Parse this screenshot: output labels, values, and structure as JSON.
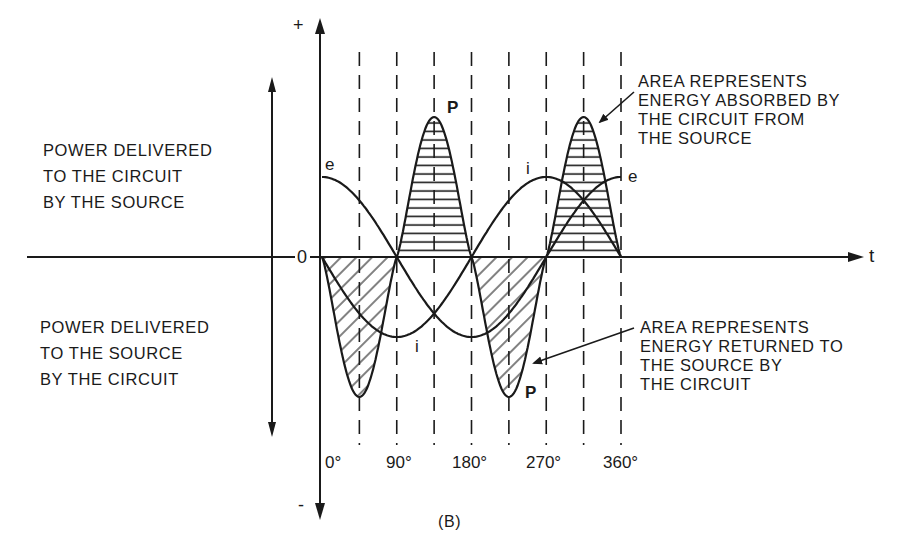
{
  "figure": {
    "caption": "(B)",
    "axis": {
      "positive_sign": "+",
      "negative_sign": "-",
      "zero_label": "0",
      "time_label": "t"
    },
    "x_ticks": [
      "0°",
      "90°",
      "180°",
      "270°",
      "360°"
    ],
    "curve_labels": {
      "e_top": "e",
      "e_right": "e",
      "i_top": "i",
      "i_bottom": "i",
      "p_top": "P",
      "p_bottom": "P"
    },
    "side_labels": {
      "upper": "POWER DELIVERED\nTO THE CIRCUIT\nBY THE SOURCE",
      "lower": "POWER DELIVERED\nTO THE SOURCE\nBY THE CIRCUIT"
    },
    "annotations": {
      "absorbed": "AREA REPRESENTS\nENERGY ABSORBED BY\nTHE CIRCUIT FROM\nTHE SOURCE",
      "returned": "AREA REPRESENTS\nENERGY RETURNED TO\nTHE SOURCE BY\nTHE CIRCUIT"
    },
    "colors": {
      "ink": "#1a1a1a",
      "background": "#ffffff"
    }
  },
  "chart_data": {
    "type": "line",
    "title": "",
    "xlabel": "t",
    "ylabel": "",
    "x_unit": "degrees",
    "x_ticks": [
      0,
      90,
      180,
      270,
      360
    ],
    "dashed_gridlines_deg": [
      45,
      90,
      135,
      180,
      225,
      270,
      315,
      360
    ],
    "series": [
      {
        "name": "e",
        "description": "voltage, max at 0°, zero at 90° and 270°",
        "amplitude": 1.0
      },
      {
        "name": "i",
        "description": "current, 90° out of phase with e",
        "amplitude": 1.0
      },
      {
        "name": "P",
        "description": "instantaneous power p = e·i, double frequency, zero average",
        "amplitude": 1.75
      }
    ],
    "shaded_regions": [
      {
        "range_deg": [
          0,
          90
        ],
        "sign": "negative",
        "hatch": "diagonal",
        "meaning": "energy returned to the source by the circuit"
      },
      {
        "range_deg": [
          90,
          180
        ],
        "sign": "positive",
        "hatch": "horizontal",
        "meaning": "energy absorbed by the circuit from the source"
      },
      {
        "range_deg": [
          180,
          270
        ],
        "sign": "negative",
        "hatch": "diagonal",
        "meaning": "energy returned to the source by the circuit"
      },
      {
        "range_deg": [
          270,
          360
        ],
        "sign": "positive",
        "hatch": "horizontal",
        "meaning": "energy absorbed by the circuit from the source"
      }
    ],
    "legend": "none",
    "grid": "vertical dashed lines every 45°"
  }
}
